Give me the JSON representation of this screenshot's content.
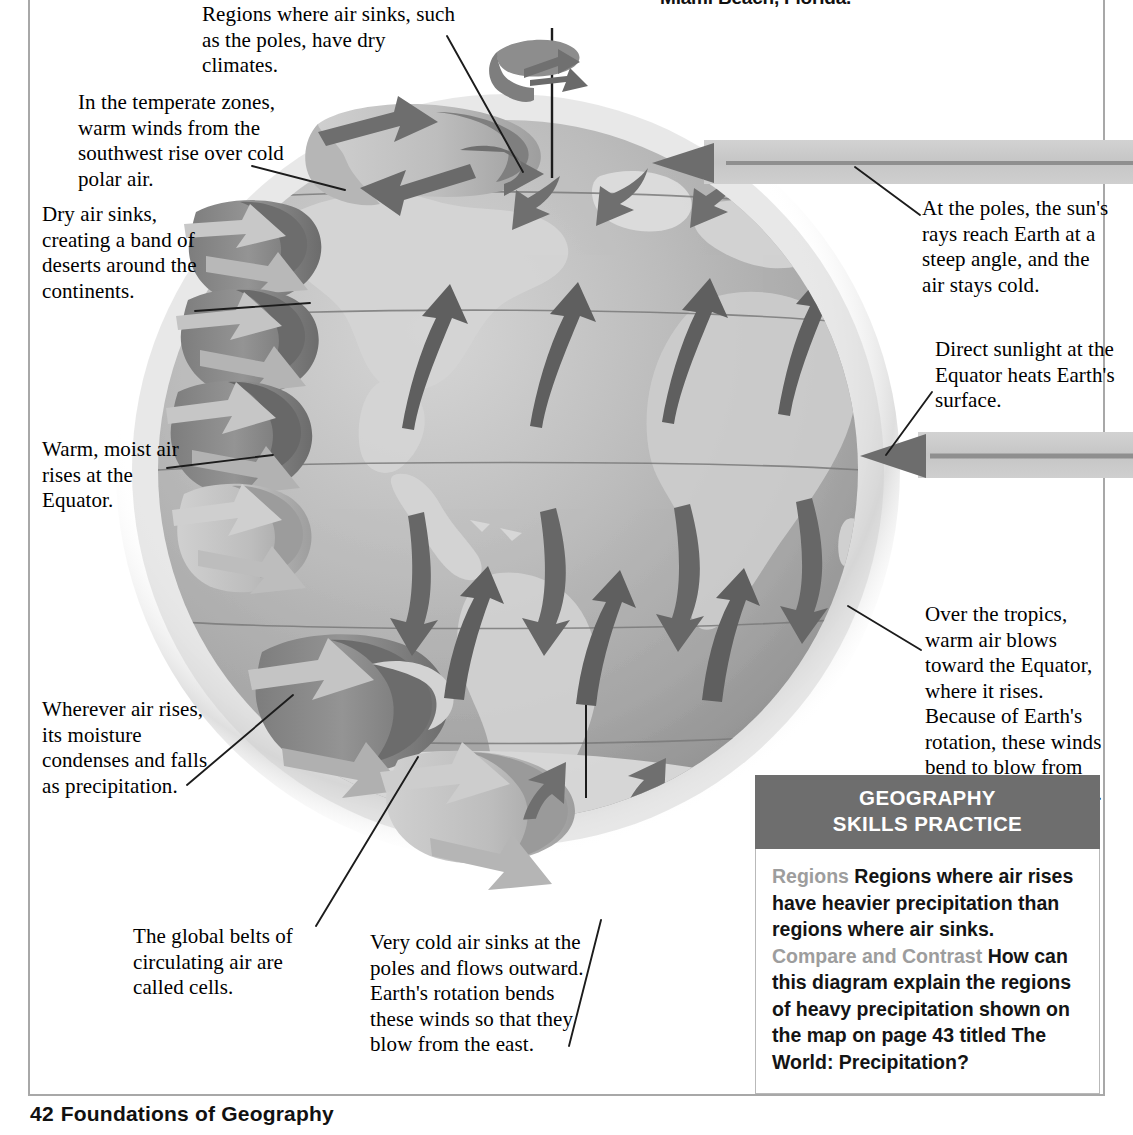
{
  "page": {
    "top_caption": "Miami Beach, Florida.",
    "footer_page_number": "42",
    "footer_title": "Foundations of Geography"
  },
  "callouts": [
    {
      "id": "poles-dry-climates",
      "text": "Regions where air sinks, such as the poles, have dry climates."
    },
    {
      "id": "temperate-zones",
      "text": "In the temperate zones, warm winds from the southwest rise over cold polar air."
    },
    {
      "id": "dry-air-sinks",
      "text": "Dry air sinks, creating a band of deserts around the continents."
    },
    {
      "id": "warm-moist-air",
      "text": "Warm, moist air rises at the Equator."
    },
    {
      "id": "moisture-condenses",
      "text": "Wherever air rises, its moisture condenses and falls as precipitation."
    },
    {
      "id": "global-belts-cells",
      "text": "The global belts of circulating air are called cells."
    },
    {
      "id": "very-cold-air-sinks",
      "text": "Very cold air sinks at the poles and flows outward. Earth's rotation bends these winds so that they blow from the east."
    },
    {
      "id": "poles-sun-rays",
      "text": "At the poles, the sun's rays reach Earth at a steep angle, and the air stays cold."
    },
    {
      "id": "direct-sunlight-equator",
      "text": "Direct sunlight at the Equator heats Earth's surface."
    },
    {
      "id": "over-the-tropics",
      "text": "Over the tropics, warm air blows toward the Equator, where it rises. Because of Earth's rotation, these winds bend to blow from the southeast or east."
    }
  ],
  "skills_practice": {
    "header_line1": "GEOGRAPHY",
    "header_line2": "SKILLS PRACTICE",
    "item1_lead": "Regions",
    "item1_text": "Regions where air rises have heavier precipitation than regions where air sinks.",
    "item2_lead": "Compare and Contrast",
    "item2_text": "How can this diagram explain the regions of heavy precipitation shown on the map on page 43 titled The World: Precipitation?"
  },
  "colors": {
    "header_gray": "#6e6e6e",
    "lead_gray": "#9d9d9d",
    "frame_gray": "#a8a8a8",
    "globe_ocean": "#a9a9a9",
    "globe_land": "#cfcfcf",
    "arrow_dark": "#6f6f6f",
    "arrow_mid": "#8c8c8c",
    "arrow_light": "#bdbdbd",
    "ray_band": "#c9c9c9",
    "ray_core": "#8f8f8f"
  }
}
